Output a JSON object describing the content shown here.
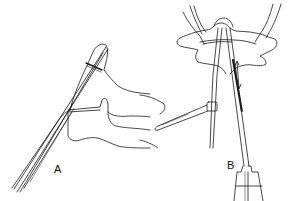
{
  "figure": {
    "panels": [
      {
        "id": "A",
        "label": "A",
        "description": "lateral view of vertebrae with instrument inserted through pedicle"
      },
      {
        "id": "B",
        "label": "B",
        "description": "axial view of vertebra with two instruments and handle"
      }
    ],
    "colors": {
      "line": "#1a1a1a",
      "background": "#ffffff"
    }
  }
}
